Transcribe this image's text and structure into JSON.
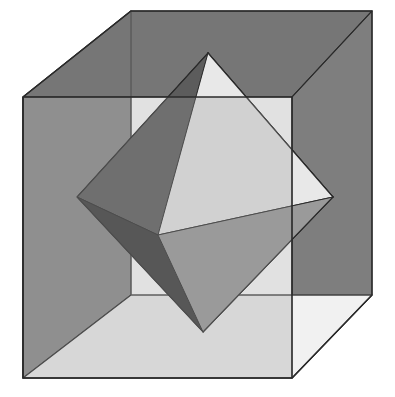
{
  "figure": {
    "type": "geometric-solid-diagram",
    "canvas": {
      "width": 395,
      "height": 397,
      "background": "#ffffff"
    }
  },
  "palette": {
    "cube_top_face": "#767676",
    "cube_left_face": "#8a8a8a",
    "cube_right_face": "#7e7e7e",
    "cube_bottom_face": "#f1f1f1",
    "cube_front_face_tint": "#9c9c9c",
    "octa_face_bright": "#e8e8e8",
    "octa_face_light": "#d8d8d8",
    "octa_face_mid": "#9a9a9a",
    "octa_face_dark": "#5c5c5c",
    "octa_face_darker": "#4a4a4a",
    "octa_face_darkest": "#3a3a3a",
    "edge_stroke": "#2b2b2b",
    "edge_stroke_soft": "#555555"
  },
  "geometry": {
    "cube_vertices": {
      "front_top_left": [
        23,
        97
      ],
      "front_top_right": [
        292,
        97
      ],
      "front_bottom_left": [
        23,
        378
      ],
      "front_bottom_right": [
        292,
        378
      ],
      "back_top_left": [
        131,
        11
      ],
      "back_top_right": [
        372,
        11
      ],
      "back_bottom_left": [
        131,
        295
      ],
      "back_bottom_right": [
        372,
        295
      ]
    },
    "octahedron_vertices": {
      "top": [
        208,
        53
      ],
      "bottom": [
        203,
        332
      ],
      "left": [
        77,
        197
      ],
      "right": [
        333,
        197
      ],
      "front": [
        158,
        235
      ],
      "back": [
        253,
        150
      ]
    }
  },
  "layers": [
    {
      "name": "cube-left-face",
      "label": "Cube left face"
    },
    {
      "name": "cube-top-face",
      "label": "Cube top face"
    },
    {
      "name": "cube-right-face",
      "label": "Cube right face"
    },
    {
      "name": "cube-bottom-face",
      "label": "Cube bottom face"
    },
    {
      "name": "cube-front-face",
      "label": "Cube front face"
    },
    {
      "name": "octahedron-body",
      "label": "Inscribed octahedron"
    }
  ],
  "octahedron_faces": [
    {
      "name": "top-back-right",
      "shade": "light",
      "verts": "top,back,right"
    },
    {
      "name": "top-left-back",
      "shade": "dark",
      "verts": "top,left,back"
    },
    {
      "name": "top-front-left",
      "shade": "dark",
      "verts": "top,left,front"
    },
    {
      "name": "top-front-right",
      "shade": "bright",
      "verts": "top,front,right"
    },
    {
      "name": "bottom-front-left",
      "shade": "darkest",
      "verts": "bottom,left,front"
    },
    {
      "name": "bottom-front-right",
      "shade": "mid",
      "verts": "bottom,front,right"
    }
  ],
  "caption": {
    "shown": false,
    "text": ""
  }
}
